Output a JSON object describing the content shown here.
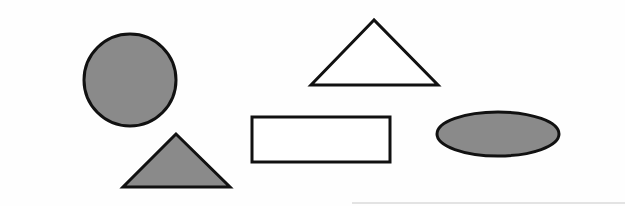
{
  "colors": {
    "background": "#fefefe",
    "stroke": "#111111",
    "fill_gray": "#8a8a8a",
    "fill_none": "#ffffff",
    "baseline": "#c8c8c8"
  },
  "shapes": [
    {
      "name": "filled-circle",
      "type": "circle",
      "cx": 130,
      "cy": 80,
      "r": 46,
      "filled": true
    },
    {
      "name": "filled-triangle",
      "type": "triangle",
      "points": [
        [
          176,
          134
        ],
        [
          123,
          187
        ],
        [
          230,
          187
        ]
      ],
      "filled": true
    },
    {
      "name": "outline-triangle",
      "type": "triangle",
      "points": [
        [
          374,
          20
        ],
        [
          311,
          85
        ],
        [
          438,
          85
        ]
      ],
      "filled": false
    },
    {
      "name": "outline-rectangle",
      "type": "rectangle",
      "x": 252,
      "y": 117,
      "width": 138,
      "height": 45,
      "filled": false
    },
    {
      "name": "filled-ellipse",
      "type": "ellipse",
      "cx": 498,
      "cy": 134,
      "rx": 61,
      "ry": 22,
      "filled": true
    }
  ],
  "baseline": {
    "x1": 352,
    "y1": 203,
    "x2": 625,
    "y2": 203
  }
}
